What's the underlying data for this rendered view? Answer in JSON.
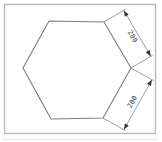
{
  "drawing": {
    "shape": "hexagon",
    "frame_border_color": "#b5b9b9",
    "background_color": "#ffffff",
    "line_color": "#787d7e",
    "dim_line_color": "#828788",
    "arrow_color": "#2f3132",
    "text_color": "#3b3d3e",
    "bottom_edge_shadow_color": "#e2e5e5",
    "dimensions": [
      {
        "label": "200",
        "edge": "top-right"
      },
      {
        "label": "200",
        "edge": "bottom-right"
      }
    ]
  }
}
